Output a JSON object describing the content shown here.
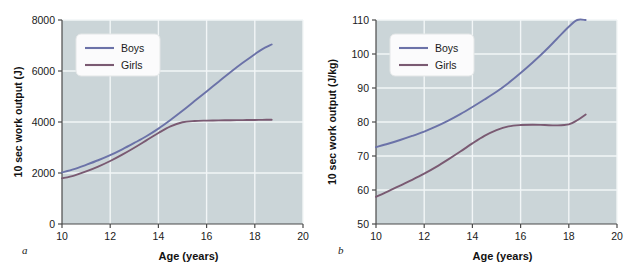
{
  "figure": {
    "background_color": "#ffffff",
    "plot_background_color": "#cbd5d8",
    "grid_color": "#f2f6f7",
    "axis_color": "#4a4a4a"
  },
  "panels": [
    {
      "letter": "a",
      "legend": {
        "boys": "Boys",
        "girls": "Girls"
      }
    },
    {
      "letter": "b",
      "legend": {
        "boys": "Boys",
        "girls": "Girls"
      }
    }
  ],
  "chart_data": [
    {
      "type": "line",
      "panel": "a",
      "title": "",
      "xlabel": "Age (years)",
      "ylabel": "10 sec work output (J)",
      "xlim": [
        10,
        20
      ],
      "ylim": [
        0,
        8000
      ],
      "xticks": [
        10,
        12,
        14,
        16,
        18,
        20
      ],
      "xticklabels": [
        "10",
        "12",
        "14",
        "16",
        "18",
        "20"
      ],
      "yticks": [
        0,
        2000,
        4000,
        6000,
        8000
      ],
      "yticklabels": [
        "0",
        "2000",
        "4000",
        "6000",
        "8000"
      ],
      "grid": true,
      "legend_position": "upper-left-inside",
      "series": [
        {
          "name": "Boys",
          "color": "#6b72a8",
          "x": [
            10.0,
            10.5,
            11.0,
            11.5,
            12.0,
            12.5,
            13.0,
            13.5,
            14.0,
            14.5,
            15.0,
            15.5,
            16.0,
            16.5,
            17.0,
            17.5,
            18.0,
            18.3,
            18.7
          ],
          "y": [
            2020,
            2150,
            2320,
            2500,
            2700,
            2930,
            3180,
            3440,
            3740,
            4080,
            4440,
            4820,
            5200,
            5580,
            5960,
            6320,
            6660,
            6850,
            7040
          ]
        },
        {
          "name": "Girls",
          "color": "#7a5a72",
          "x": [
            10.0,
            10.5,
            11.0,
            11.5,
            12.0,
            12.5,
            13.0,
            13.5,
            14.0,
            14.5,
            15.0,
            15.5,
            16.0,
            16.5,
            17.0,
            17.5,
            18.0,
            18.3,
            18.7
          ],
          "y": [
            1790,
            1900,
            2060,
            2250,
            2470,
            2720,
            2990,
            3280,
            3570,
            3830,
            3990,
            4040,
            4055,
            4065,
            4070,
            4075,
            4080,
            4085,
            4090
          ]
        }
      ]
    },
    {
      "type": "line",
      "panel": "b",
      "title": "",
      "xlabel": "Age (years)",
      "ylabel": "10 sec work output (J/kg)",
      "xlim": [
        10,
        20
      ],
      "ylim": [
        50,
        110
      ],
      "xticks": [
        10,
        12,
        14,
        16,
        18,
        20
      ],
      "xticklabels": [
        "10",
        "12",
        "14",
        "16",
        "18",
        "20"
      ],
      "yticks": [
        50,
        60,
        70,
        80,
        90,
        100,
        110
      ],
      "yticklabels": [
        "50",
        "60",
        "70",
        "80",
        "90",
        "100",
        "110"
      ],
      "grid": true,
      "legend_position": "upper-left-inside",
      "series": [
        {
          "name": "Boys",
          "color": "#6b72a8",
          "x": [
            10.0,
            10.5,
            11.0,
            11.5,
            12.0,
            12.5,
            13.0,
            13.5,
            14.0,
            14.5,
            15.0,
            15.5,
            16.0,
            16.5,
            17.0,
            17.5,
            18.0,
            18.35,
            18.7
          ],
          "y": [
            72.6,
            73.6,
            74.7,
            75.9,
            77.2,
            78.7,
            80.4,
            82.3,
            84.4,
            86.6,
            88.9,
            91.5,
            94.4,
            97.5,
            100.8,
            104.4,
            108.0,
            110.0,
            110.0
          ]
        },
        {
          "name": "Girls",
          "color": "#7a5a72",
          "x": [
            10.0,
            10.5,
            11.0,
            11.5,
            12.0,
            12.5,
            13.0,
            13.5,
            14.0,
            14.5,
            15.0,
            15.5,
            16.0,
            16.5,
            17.0,
            17.5,
            18.0,
            18.35,
            18.7
          ],
          "y": [
            58.0,
            59.6,
            61.3,
            63.0,
            64.8,
            66.8,
            69.0,
            71.3,
            73.7,
            75.9,
            77.6,
            78.7,
            79.1,
            79.2,
            79.1,
            79.0,
            79.3,
            80.5,
            82.2
          ]
        }
      ]
    }
  ]
}
